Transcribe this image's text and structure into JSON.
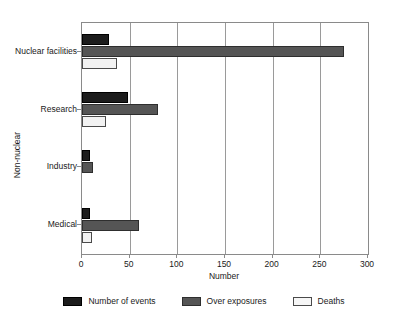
{
  "chart_data": {
    "type": "bar",
    "orientation": "horizontal",
    "grouped": true,
    "title": "",
    "xlabel": "Number",
    "ylabel": "Non-nuclear",
    "xlim": [
      0,
      300
    ],
    "xticks": [
      0,
      50,
      100,
      150,
      200,
      250,
      300
    ],
    "grid": "vertical",
    "legend_position": "bottom",
    "categories": [
      "Nuclear facilities",
      "Research",
      "Industry",
      "Medical"
    ],
    "series": [
      {
        "name": "Number of events",
        "color": "#1c1c1c",
        "values": [
          28,
          48,
          8,
          8
        ]
      },
      {
        "name": "Over exposures",
        "color": "#555555",
        "values": [
          275,
          80,
          12,
          60
        ]
      },
      {
        "name": "Deaths",
        "color": "#f2f2f2",
        "values": [
          37,
          25,
          0,
          11
        ]
      }
    ]
  },
  "axis": {
    "x_title": "Number",
    "y_title": "Non-nuclear",
    "x_tick_labels": [
      "0",
      "50",
      "100",
      "150",
      "200",
      "250",
      "300"
    ],
    "y_tick_labels": [
      "Nuclear facilities",
      "Research",
      "Industry",
      "Medical"
    ]
  },
  "legend": {
    "items": [
      {
        "label": "Number of events",
        "key": "events"
      },
      {
        "label": "Over exposures",
        "key": "over"
      },
      {
        "label": "Deaths",
        "key": "deaths"
      }
    ]
  }
}
